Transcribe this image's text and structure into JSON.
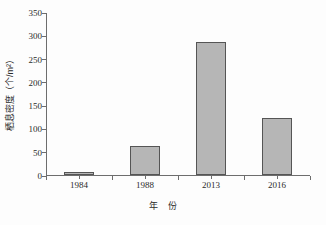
{
  "chart_data": {
    "type": "bar",
    "title": "",
    "subtitle": "",
    "categories": [
      "1984",
      "1988",
      "2013",
      "2016"
    ],
    "values": [
      7,
      62,
      285,
      122
    ],
    "xlabel": "年　份",
    "xlabel_parts": {
      "first": "年",
      "second": "份"
    },
    "ylabel": "栖息密度（个/m²）",
    "ylim": [
      0,
      350
    ],
    "ytick_values": [
      0,
      50,
      100,
      150,
      200,
      250,
      300,
      350
    ],
    "ytick_labels": [
      "0",
      "50",
      "100",
      "150",
      "200",
      "250",
      "300",
      "350"
    ],
    "grid": false,
    "legend": null,
    "legend_position": "none",
    "series": [
      {
        "name": "栖息密度",
        "values": [
          7,
          62,
          285,
          122
        ]
      }
    ],
    "annotations": [],
    "colors": {
      "bar_fill": "#b6b6b6",
      "bar_border": "#555555",
      "axis": "#6d6d6d",
      "text": "#2b2b2b",
      "background": "#fdfdfd"
    }
  }
}
